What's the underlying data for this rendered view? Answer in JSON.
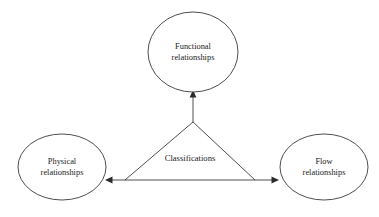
{
  "diagram": {
    "background_color": "#ffffff",
    "stroke_color": "#3a3a3a",
    "text_color": "#1a1a1a",
    "center_label": "Classifications",
    "nodes": [
      {
        "id": "functional",
        "line1": "Functional",
        "line2": "relationships",
        "cx": 193,
        "cy": 52,
        "rx": 45,
        "ry": 40
      },
      {
        "id": "physical",
        "line1": "Physical",
        "line2": "relationships",
        "cx": 62,
        "cy": 167,
        "rx": 44,
        "ry": 33
      },
      {
        "id": "flow",
        "line1": "Flow",
        "line2": "relationships",
        "cx": 324,
        "cy": 167,
        "rx": 44,
        "ry": 33
      }
    ],
    "arrows": [
      {
        "id": "to-functional",
        "direction": "up"
      },
      {
        "id": "to-physical",
        "direction": "left"
      },
      {
        "id": "to-flow",
        "direction": "right"
      }
    ]
  }
}
